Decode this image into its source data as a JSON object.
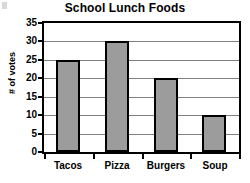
{
  "chart_data": {
    "type": "bar",
    "title": "School Lunch Foods",
    "xlabel": "",
    "ylabel": "# of votes",
    "categories": [
      "Tacos",
      "Pizza",
      "Burgers",
      "Soup"
    ],
    "values": [
      25,
      30,
      20,
      10
    ],
    "ylim": [
      0,
      35
    ],
    "ytick_step": 5,
    "yticks": [
      0,
      5,
      10,
      15,
      20,
      25,
      30,
      35
    ],
    "ytick_labels": [
      "0",
      "5",
      "10",
      "15",
      "20",
      "25",
      "30",
      "35"
    ],
    "grid": true,
    "grid_axis": "y",
    "legend": false,
    "legend_position": "none",
    "bar_fill_color": "#9c9c9c",
    "bar_border_color": "#000000",
    "gridline_color": "#808080",
    "axis_color": "#000000",
    "background_color": "#ffffff",
    "text_color": "#000000"
  },
  "axes": {
    "y_title": "# of votes"
  }
}
